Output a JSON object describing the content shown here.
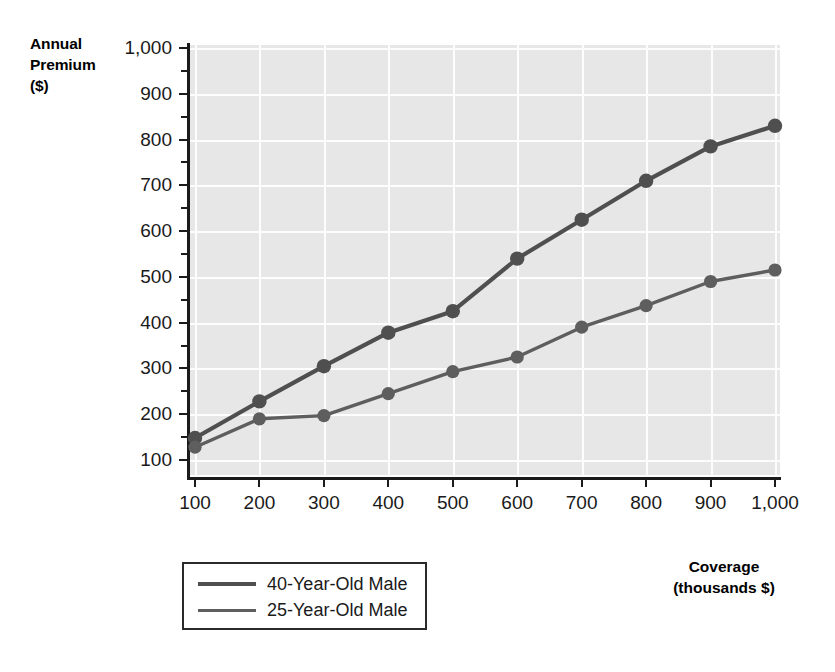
{
  "axes": {
    "y_title": "Annual\nPremium\n($)",
    "y_title_line1": "Annual",
    "y_title_line2": "Premium",
    "y_title_line3": "($)",
    "x_title_line1": "Coverage",
    "x_title_line2": "(thousands $)",
    "y_ticks": [
      "100",
      "200",
      "300",
      "400",
      "500",
      "600",
      "700",
      "800",
      "900",
      "1,000"
    ],
    "x_ticks": [
      "100",
      "200",
      "300",
      "400",
      "500",
      "600",
      "700",
      "800",
      "900",
      "1,000"
    ]
  },
  "legend": {
    "items": [
      {
        "label": "40-Year-Old Male",
        "color": "#4f4f4f"
      },
      {
        "label": "25-Year-Old Male",
        "color": "#5e5e5e"
      }
    ]
  },
  "colors": {
    "plot_background": "#e7e7e7",
    "gridline": "#fdfdfd",
    "axis": "#1b1b1b",
    "series_40": "#4f4f4f",
    "series_25": "#5e5e5e",
    "page_background": "#ffffff"
  },
  "chart_data": {
    "type": "line",
    "title": "",
    "xlabel": "Coverage (thousands $)",
    "ylabel": "Annual Premium ($)",
    "xlim": [
      100,
      1000
    ],
    "ylim": [
      100,
      1000
    ],
    "y_major_step": 100,
    "y_minor_step": 50,
    "x_step": 100,
    "grid": true,
    "legend_position": "bottom-left",
    "markers": "filled-circle",
    "x": [
      100,
      200,
      300,
      400,
      500,
      600,
      700,
      800,
      900,
      1000
    ],
    "series": [
      {
        "name": "40-Year-Old Male",
        "color": "#4f4f4f",
        "values": [
          148,
          228,
          305,
          378,
          425,
          540,
          625,
          710,
          785,
          830
        ]
      },
      {
        "name": "25-Year-Old Male",
        "color": "#5e5e5e",
        "values": [
          128,
          190,
          197,
          245,
          293,
          325,
          390,
          437,
          490,
          515
        ]
      }
    ]
  }
}
